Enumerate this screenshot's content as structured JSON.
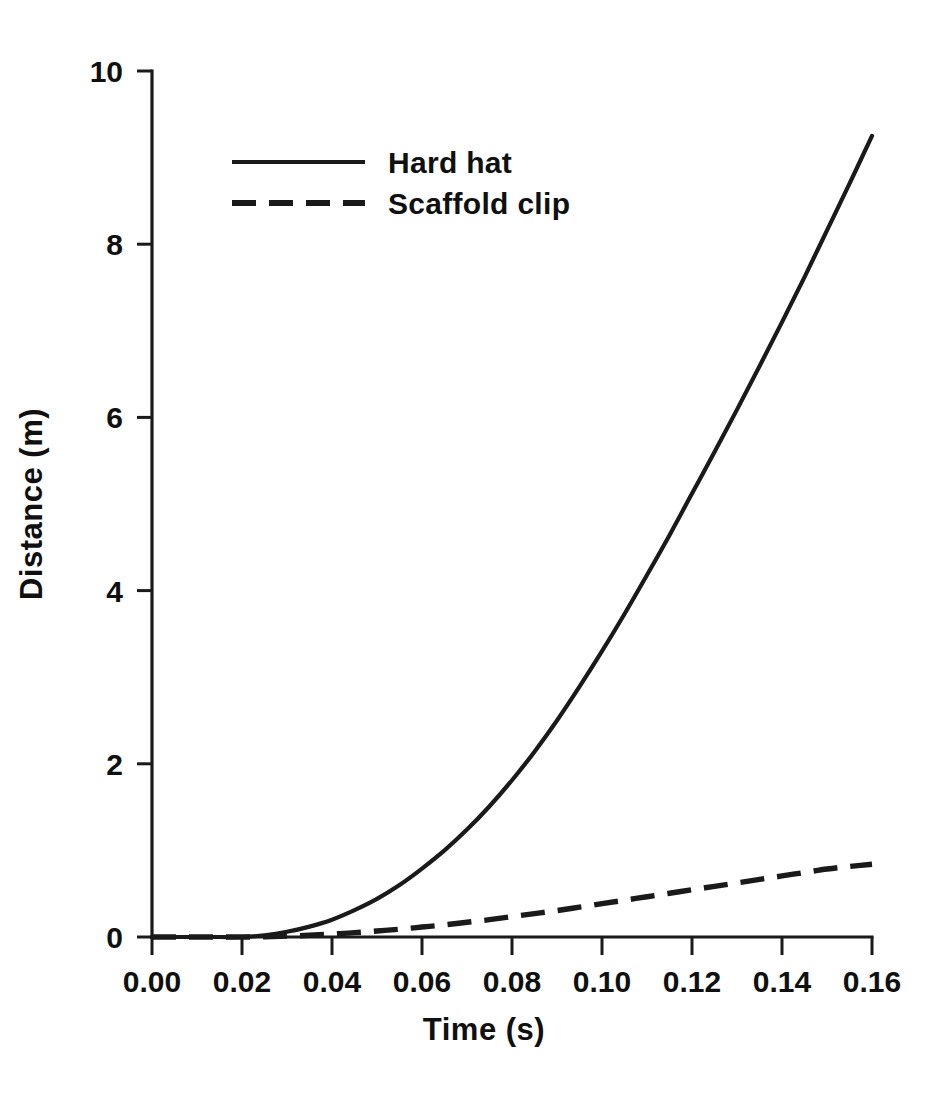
{
  "chart_data": {
    "type": "line",
    "title": "",
    "xlabel": "Time  (s)",
    "ylabel": "Distance  (m)",
    "xlim": [
      0.0,
      0.16
    ],
    "ylim": [
      0,
      10
    ],
    "grid": false,
    "legend_position": "upper-left-inside",
    "x_tick_labels": [
      "0.00",
      "0.02",
      "0.04",
      "0.06",
      "0.08",
      "0.10",
      "0.12",
      "0.14",
      "0.16"
    ],
    "x_tick_values": [
      0.0,
      0.02,
      0.04,
      0.06,
      0.08,
      0.1,
      0.12,
      0.14,
      0.16
    ],
    "y_tick_labels": [
      "0",
      "2",
      "4",
      "6",
      "8",
      "10"
    ],
    "y_tick_values": [
      0,
      2,
      4,
      6,
      8,
      10
    ],
    "x": [
      0.0,
      0.005,
      0.01,
      0.015,
      0.02,
      0.025,
      0.03,
      0.035,
      0.04,
      0.045,
      0.05,
      0.055,
      0.06,
      0.065,
      0.07,
      0.075,
      0.08,
      0.085,
      0.09,
      0.095,
      0.1,
      0.105,
      0.11,
      0.115,
      0.12,
      0.125,
      0.13,
      0.135,
      0.14,
      0.145,
      0.15,
      0.155,
      0.16
    ],
    "series": [
      {
        "name": "Hard hat",
        "style": "solid",
        "color": "#1a1a1a",
        "values": [
          0.0,
          0.0,
          0.0,
          0.0,
          0.0,
          0.02,
          0.06,
          0.12,
          0.2,
          0.31,
          0.44,
          0.6,
          0.79,
          1.0,
          1.24,
          1.51,
          1.81,
          2.14,
          2.5,
          2.89,
          3.3,
          3.73,
          4.18,
          4.64,
          5.12,
          5.6,
          6.09,
          6.59,
          7.1,
          7.62,
          8.16,
          8.7,
          9.25
        ]
      },
      {
        "name": "Scaffold clip",
        "style": "dashed",
        "color": "#1a1a1a",
        "values": [
          0.0,
          0.0,
          0.0,
          0.0,
          0.0,
          0.003,
          0.01,
          0.02,
          0.035,
          0.05,
          0.07,
          0.09,
          0.115,
          0.14,
          0.17,
          0.2,
          0.235,
          0.27,
          0.305,
          0.345,
          0.385,
          0.425,
          0.465,
          0.505,
          0.545,
          0.585,
          0.625,
          0.665,
          0.705,
          0.745,
          0.785,
          0.815,
          0.84
        ]
      }
    ]
  },
  "legend": {
    "entries": [
      {
        "label": "Hard hat",
        "style": "solid"
      },
      {
        "label": "Scaffold clip",
        "style": "dashed"
      }
    ]
  }
}
